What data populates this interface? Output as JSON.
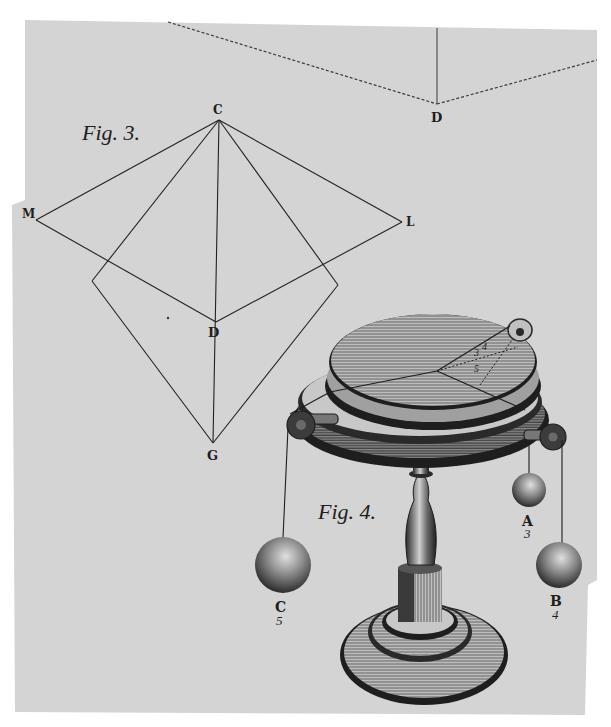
{
  "plate": {
    "paper_color": "#d4d4d4",
    "ink_color": "#1e1e1e",
    "margin_color": "#ffffff"
  },
  "fig3": {
    "caption": "Fig. 3.",
    "points": {
      "C": "C",
      "M": "M",
      "L": "L",
      "D": "D",
      "G": "G"
    }
  },
  "fig_top": {
    "point_D": "D"
  },
  "fig4": {
    "caption": "Fig. 4.",
    "table_numbers": [
      "4",
      "3",
      "5"
    ],
    "weights": [
      {
        "letter": "A",
        "number": "3"
      },
      {
        "letter": "B",
        "number": "4"
      },
      {
        "letter": "C",
        "number": "5"
      }
    ]
  }
}
